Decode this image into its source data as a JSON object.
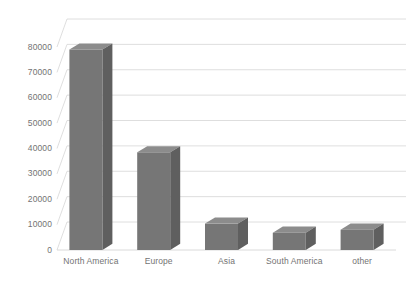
{
  "chart_data": {
    "type": "bar",
    "style": "3d-column",
    "title": "",
    "subtitle": "",
    "xlabel": "",
    "ylabel": "",
    "categories": [
      "North America",
      "Europe",
      "Asia",
      "South America",
      "other"
    ],
    "values": [
      79000,
      38500,
      10400,
      6800,
      8000
    ],
    "series": [
      {
        "name": "",
        "values": [
          79000,
          38500,
          10400,
          6800,
          8000
        ]
      }
    ],
    "ylim": [
      0,
      80000
    ],
    "ytick_labels": [
      "0",
      "10000",
      "20000",
      "30000",
      "40000",
      "50000",
      "60000",
      "70000",
      "80000"
    ],
    "ytick_values": [
      0,
      10000,
      20000,
      30000,
      40000,
      50000,
      60000,
      70000,
      80000
    ],
    "grid": true,
    "grid_axis": "y",
    "legend": false,
    "legend_position": "none",
    "annotations": []
  },
  "colors": {
    "bar_front": "#767676",
    "bar_side": "#5f5f5f",
    "bar_top": "#8c8c8c",
    "gridline": "#d6d6d6",
    "floor_line": "#d0d0d0",
    "axis_text": "#737373",
    "background": "#ffffff"
  },
  "axes": {
    "y_axis_name": "value-axis",
    "x_axis_name": "category-axis"
  }
}
